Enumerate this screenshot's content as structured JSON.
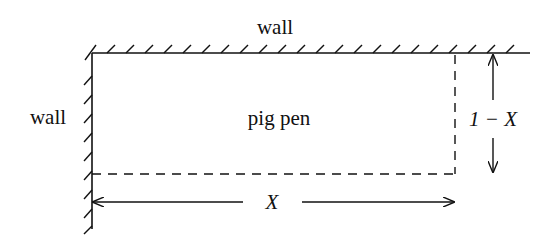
{
  "diagram": {
    "labels": {
      "top_wall": "wall",
      "left_wall": "wall",
      "pen": "pig pen",
      "height": "1 − X",
      "width": "X"
    },
    "colors": {
      "stroke": "#111111",
      "background": "#ffffff"
    }
  }
}
